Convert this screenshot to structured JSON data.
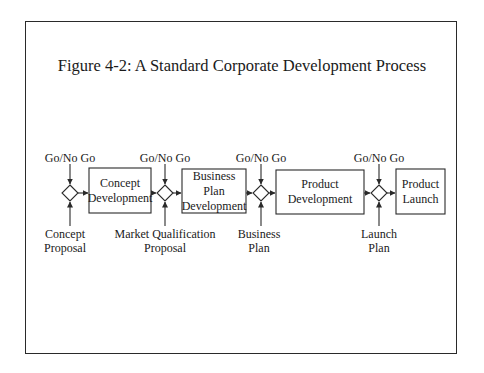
{
  "title": "Figure 4-2: A Standard Corporate Development Process",
  "gates": [
    {
      "top_label": "Go/No Go",
      "bottom_label": [
        "Concept",
        "Proposal"
      ]
    },
    {
      "top_label": "Go/No Go",
      "bottom_label": [
        "Market Qualification",
        "Proposal"
      ]
    },
    {
      "top_label": "Go/No Go",
      "bottom_label": [
        "Business",
        "Plan"
      ]
    },
    {
      "top_label": "Go/No Go",
      "bottom_label": [
        "Launch",
        "Plan"
      ]
    }
  ],
  "stages": [
    {
      "label": [
        "Concept",
        "Development"
      ]
    },
    {
      "label": [
        "Business",
        "Plan",
        "Development"
      ]
    },
    {
      "label": [
        "Product",
        "Development"
      ]
    },
    {
      "label": [
        "Product",
        "Launch"
      ]
    }
  ],
  "colors": {
    "stroke": "#2a2a2a",
    "background": "#ffffff"
  }
}
